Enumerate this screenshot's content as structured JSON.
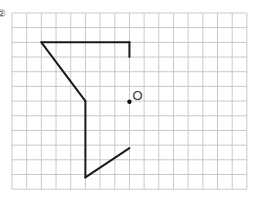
{
  "problem_marker": "②",
  "grid": {
    "origin_x": 12,
    "origin_y": 13,
    "cell": 14.68,
    "cols": 16,
    "rows": 12,
    "line_color": "#c8c8c8"
  },
  "shape": {
    "stroke_color": "#1a1a1a",
    "segments_grid": [
      [
        [
          2,
          2
        ],
        [
          8,
          2
        ]
      ],
      [
        [
          8,
          2
        ],
        [
          8,
          3
        ]
      ],
      [
        [
          2,
          2
        ],
        [
          5,
          6
        ]
      ],
      [
        [
          5,
          6
        ],
        [
          5,
          11.2
        ]
      ],
      [
        [
          5,
          11.2
        ],
        [
          8,
          9.2
        ]
      ]
    ]
  },
  "point_o": {
    "label": "O",
    "grid_x": 8,
    "grid_y": 6.05
  }
}
